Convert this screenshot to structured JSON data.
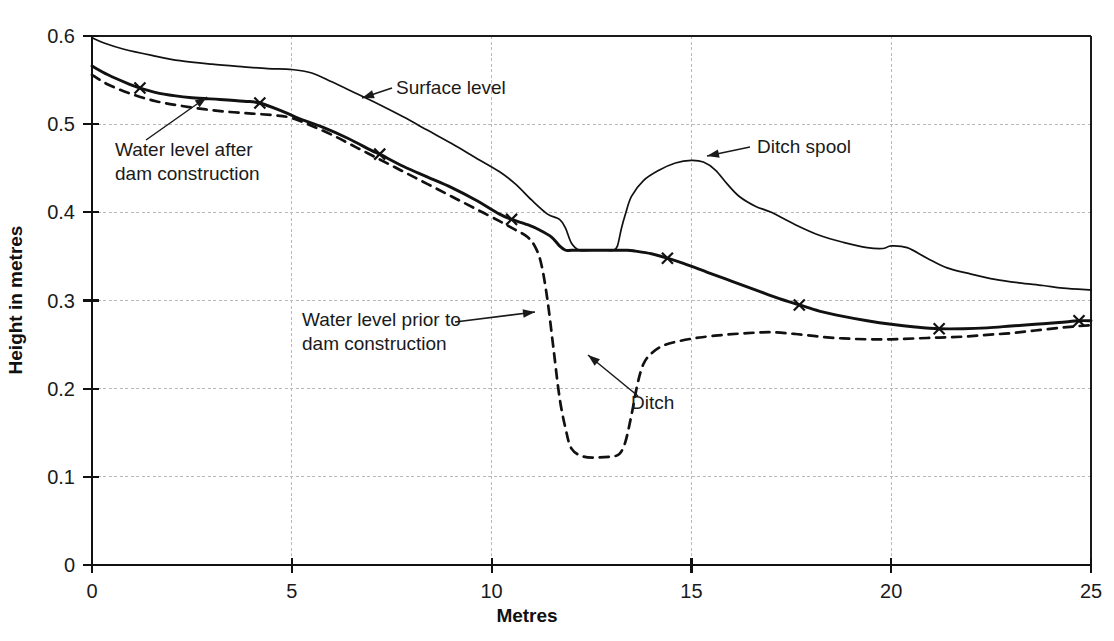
{
  "chart_data": {
    "type": "line",
    "title": "",
    "xlabel": "Metres",
    "ylabel": "Height in metres",
    "xlim": [
      0,
      25
    ],
    "ylim": [
      0,
      0.6
    ],
    "grid": true,
    "legend_position": "none",
    "xticks": [
      "0",
      "5",
      "10",
      "15",
      "20",
      "25"
    ],
    "xtick_values": [
      0,
      5,
      10,
      15,
      20,
      25
    ],
    "yticks": [
      "0",
      "0.1",
      "0.2",
      "0.3",
      "0.4",
      "0.5",
      "0.6"
    ],
    "ytick_values": [
      0,
      0.1,
      0.2,
      0.3,
      0.4,
      0.5,
      0.6
    ],
    "series": [
      {
        "name": "Surface level",
        "style": "thin-solid",
        "x": [
          0.0,
          0.3,
          0.8,
          1.5,
          2.2,
          3.0,
          3.8,
          4.4,
          5.0,
          5.5,
          6.0,
          6.6,
          7.2,
          7.8,
          8.4,
          9.0,
          9.6,
          10.2,
          10.6,
          11.0,
          11.4,
          11.7,
          11.85,
          12.0,
          12.2,
          12.5,
          12.75,
          12.9,
          13.05,
          13.15,
          13.25,
          13.35,
          13.5,
          13.8,
          14.2,
          14.6,
          15.0,
          15.3,
          15.6,
          15.9,
          16.2,
          16.6,
          17.0,
          17.6,
          18.2,
          18.8,
          19.4,
          19.8,
          20.0,
          20.4,
          20.9,
          21.4,
          22.0,
          22.6,
          23.2,
          23.8,
          24.3,
          25.0
        ],
        "y": [
          0.598,
          0.592,
          0.585,
          0.578,
          0.572,
          0.568,
          0.565,
          0.563,
          0.562,
          0.558,
          0.548,
          0.535,
          0.522,
          0.508,
          0.493,
          0.478,
          0.462,
          0.446,
          0.432,
          0.414,
          0.398,
          0.392,
          0.382,
          0.365,
          0.357,
          0.357,
          0.357,
          0.357,
          0.357,
          0.362,
          0.382,
          0.398,
          0.418,
          0.436,
          0.448,
          0.456,
          0.459,
          0.457,
          0.448,
          0.432,
          0.418,
          0.407,
          0.4,
          0.386,
          0.374,
          0.366,
          0.36,
          0.359,
          0.362,
          0.36,
          0.348,
          0.337,
          0.33,
          0.324,
          0.32,
          0.317,
          0.314,
          0.312
        ]
      },
      {
        "name": "Water level after dam construction",
        "style": "thick-solid-with-markers",
        "x": [
          0.0,
          0.4,
          0.9,
          1.2,
          1.8,
          2.5,
          3.2,
          3.8,
          4.2,
          4.8,
          5.2,
          5.8,
          6.4,
          7.0,
          7.2,
          7.8,
          8.4,
          9.0,
          9.6,
          10.2,
          10.5,
          10.9,
          11.2,
          11.5,
          11.7,
          11.85,
          12.0,
          12.3,
          12.6,
          13.0,
          13.4,
          13.6,
          14.0,
          14.4,
          14.8,
          15.4,
          16.0,
          16.6,
          17.2,
          17.7,
          18.2,
          18.8,
          19.4,
          20.0,
          20.6,
          21.2,
          21.8,
          22.4,
          23.0,
          23.6,
          24.2,
          24.7,
          25.0
        ],
        "y": [
          0.566,
          0.556,
          0.546,
          0.541,
          0.534,
          0.53,
          0.528,
          0.526,
          0.524,
          0.514,
          0.506,
          0.496,
          0.484,
          0.47,
          0.466,
          0.452,
          0.44,
          0.428,
          0.414,
          0.398,
          0.392,
          0.386,
          0.38,
          0.372,
          0.362,
          0.357,
          0.357,
          0.357,
          0.357,
          0.357,
          0.357,
          0.356,
          0.353,
          0.348,
          0.342,
          0.332,
          0.322,
          0.312,
          0.302,
          0.295,
          0.288,
          0.282,
          0.277,
          0.273,
          0.27,
          0.268,
          0.268,
          0.269,
          0.271,
          0.273,
          0.275,
          0.277,
          0.277
        ],
        "markers": [
          {
            "x": 1.2,
            "y": 0.541
          },
          {
            "x": 4.2,
            "y": 0.524
          },
          {
            "x": 7.2,
            "y": 0.466
          },
          {
            "x": 10.5,
            "y": 0.392
          },
          {
            "x": 14.4,
            "y": 0.348
          },
          {
            "x": 17.7,
            "y": 0.295
          },
          {
            "x": 21.2,
            "y": 0.268
          },
          {
            "x": 24.7,
            "y": 0.277
          }
        ]
      },
      {
        "name": "Water level prior to dam construction",
        "style": "dashed",
        "x": [
          0.0,
          0.4,
          1.0,
          1.6,
          2.2,
          2.8,
          3.4,
          4.0,
          4.6,
          5.0,
          5.4,
          6.0,
          6.6,
          7.2,
          7.8,
          8.4,
          9.0,
          9.6,
          10.2,
          10.6,
          10.9,
          11.1,
          11.25,
          11.4,
          11.55,
          11.7,
          11.85,
          12.0,
          12.3,
          12.7,
          13.0,
          13.2,
          13.35,
          13.5,
          13.65,
          13.8,
          14.0,
          14.3,
          14.7,
          15.2,
          15.8,
          16.4,
          17.0,
          17.6,
          18.2,
          18.8,
          19.4,
          20.0,
          20.6,
          21.2,
          21.8,
          22.4,
          23.0,
          23.6,
          24.2,
          24.7,
          25.0
        ],
        "y": [
          0.556,
          0.545,
          0.534,
          0.526,
          0.521,
          0.517,
          0.514,
          0.512,
          0.51,
          0.507,
          0.5,
          0.488,
          0.474,
          0.46,
          0.446,
          0.432,
          0.418,
          0.404,
          0.39,
          0.38,
          0.372,
          0.36,
          0.34,
          0.3,
          0.245,
          0.19,
          0.155,
          0.132,
          0.123,
          0.122,
          0.123,
          0.126,
          0.14,
          0.17,
          0.205,
          0.228,
          0.24,
          0.249,
          0.254,
          0.258,
          0.261,
          0.263,
          0.264,
          0.262,
          0.259,
          0.257,
          0.256,
          0.256,
          0.257,
          0.258,
          0.259,
          0.261,
          0.263,
          0.266,
          0.269,
          0.271,
          0.272
        ]
      }
    ],
    "annotations": [
      {
        "id": "surface-level",
        "label": "Surface level",
        "text_x": 396,
        "text_y": 94,
        "arrow_from_x": 392,
        "arrow_from_y": 88,
        "arrow_to_x": 362,
        "arrow_to_y": 98
      },
      {
        "id": "water-level-after",
        "label_line1": "Water level after",
        "label_line2": "dam construction",
        "text_x": 115,
        "text_y": 156,
        "arrow_from_x": 146,
        "arrow_from_y": 140,
        "arrow_to_x": 207,
        "arrow_to_y": 97
      },
      {
        "id": "water-level-prior",
        "label_line1": "Water level prior to",
        "label_line2": "dam construction",
        "text_x": 302,
        "text_y": 326,
        "arrow_from_x": 455,
        "arrow_from_y": 322,
        "arrow_to_x": 535,
        "arrow_to_y": 312
      },
      {
        "id": "ditch",
        "label": "Ditch",
        "text_x": 631,
        "text_y": 409,
        "arrow_from_x": 638,
        "arrow_from_y": 396,
        "arrow_to_x": 588,
        "arrow_to_y": 355
      },
      {
        "id": "ditch-spool",
        "label": "Ditch spool",
        "text_x": 757,
        "text_y": 153,
        "arrow_from_x": 750,
        "arrow_from_y": 147,
        "arrow_to_x": 707,
        "arrow_to_y": 156
      }
    ]
  },
  "colors": {
    "ink": "#111111",
    "grid": "#b9b9b9",
    "background": "#ffffff"
  }
}
